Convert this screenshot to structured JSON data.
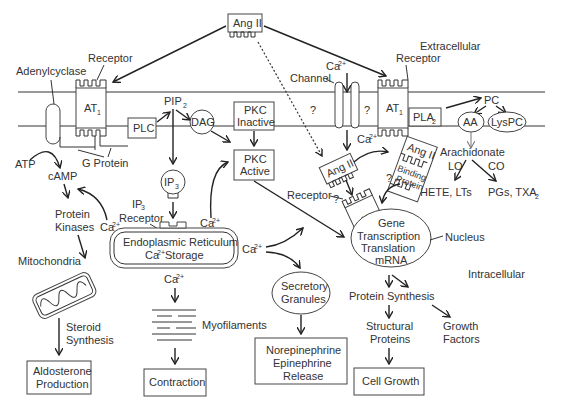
{
  "regions": {
    "extracellular": "Extracellular",
    "intracellular": "Intracellular"
  },
  "ligand": {
    "label": "Ang II"
  },
  "membrane": {
    "adenylcyclase": "Adenylcyclase",
    "receptor_left": "Receptor",
    "at1_left": "AT",
    "at1_sub": "1",
    "g_protein": "G Protein",
    "plc": "PLC",
    "pip2": "PIP",
    "pip2_sub": "2",
    "dag": "DAG",
    "channel": "Channel",
    "ca_in": "Ca",
    "ca_sup": "2+",
    "question": "?",
    "receptor_right": "Receptor",
    "at1_right": "AT",
    "pla2": "PLA",
    "pla2_sub": "2",
    "pc": "PC",
    "aa": "AA",
    "lyspc": "LysPC"
  },
  "left_pathway": {
    "atp": "ATP",
    "camp": "cAMP",
    "protein_kinases_1": "Protein",
    "protein_kinases_2": "Kinases",
    "ca": "Ca",
    "mitochondria": "Mitochondria",
    "steroid_1": "Steroid",
    "steroid_2": "Synthesis",
    "aldosterone_1": "Aldosterone",
    "aldosterone_2": "Production"
  },
  "center_pathway": {
    "ip3": "IP",
    "ip3_sub": "3",
    "ip3_receptor_1": "IP",
    "ip3_receptor_2": "Receptor",
    "er_1": "Endoplasmic Reticulum",
    "er_2": "Ca",
    "er_2b": " Storage",
    "ca_er_right": "Ca",
    "ca_er_below": "Ca",
    "ca_mid": "Ca",
    "myofilaments": "Myofilaments",
    "contraction": "Contraction",
    "pkc_inactive_1": "PKC",
    "pkc_inactive_2": "Inactive",
    "pkc_active_1": "PKC",
    "pkc_active_2": "Active",
    "secretory_1": "Secretory",
    "secretory_2": "Granules",
    "release_1": "Norepinephrine",
    "release_2": "Epinephrine",
    "release_3": "Release"
  },
  "right_pathway": {
    "ang_internal": "Ang II",
    "ang_binding": "Ang II",
    "binding_1": "Binding",
    "binding_2": "Protein",
    "receptor_internal": "Receptor",
    "at1_internal": "AT",
    "nucleus_1": "Gene",
    "nucleus_2": "Transcription",
    "nucleus_3": "Translation",
    "nucleus_4": "mRNA",
    "nucleus_label": "Nucleus",
    "arachidonate": "Arachidonate",
    "lo": "LO",
    "co": "CO",
    "hete": "HETE, LTs",
    "pgs": "PGs, TXA",
    "pgs_sub": "2",
    "protein_synthesis": "Protein Synthesis",
    "structural_1": "Structural",
    "structural_2": "Proteins",
    "growth_factors_1": "Growth",
    "growth_factors_2": "Factors",
    "cell_growth": "Cell Growth"
  }
}
